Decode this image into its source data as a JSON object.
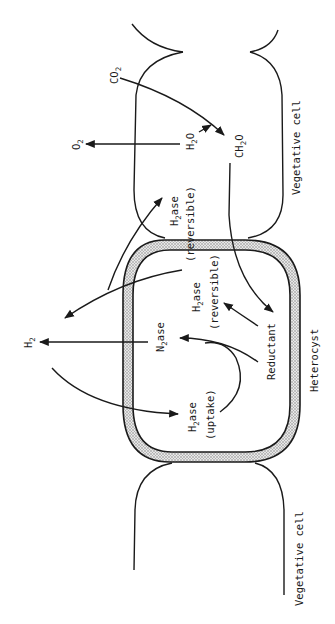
{
  "diagram": {
    "type": "hydrogen metabolism in heterocystous cyanobacteria",
    "orientation": "rotated 90 degrees counter-clockwise",
    "cells": {
      "vegetative_top": "Vegetative cell",
      "heterocyst": "Heterocyst",
      "vegetative_bottom": "Vegetative cell"
    },
    "labels": {
      "co2": {
        "main": "CO",
        "sub": "2"
      },
      "o2": {
        "main": "O",
        "sub": "2"
      },
      "h2o": {
        "main": "H",
        "sub": "2",
        "tail": "O"
      },
      "ch2o": {
        "main": "CH",
        "sub": "2",
        "tail": "O"
      },
      "h2": {
        "main": "H",
        "sub": "2"
      },
      "h2ase_reversible_veg": {
        "main": "H",
        "sub": "2",
        "tail": "ase",
        "note": "(reversible)"
      },
      "h2ase_reversible_het": {
        "main": "H",
        "sub": "2",
        "tail": "ase",
        "note": "(reversible)"
      },
      "n2ase": {
        "main": "N",
        "sub": "2",
        "tail": "ase"
      },
      "h2ase_uptake": {
        "main": "H",
        "sub": "2",
        "tail": "ase",
        "note": "(uptake)"
      },
      "reductant": "Reductant"
    },
    "edges": [
      {
        "from": "CO2",
        "to": "CH2O"
      },
      {
        "from": "H2O",
        "to": "CO2 -> CH2O pathway"
      },
      {
        "from": "H2O",
        "to": "O2"
      },
      {
        "from": "CH2O",
        "to": "Reductant"
      },
      {
        "from": "Reductant",
        "to": "H2ase (reversible, heterocyst)"
      },
      {
        "from": "Reductant",
        "to": "N2ase"
      },
      {
        "from": "N2ase",
        "to": "H2"
      },
      {
        "from": "H2ase (uptake)",
        "to": "N2ase"
      },
      {
        "from": "H2 (external)",
        "to": "H2ase (uptake)"
      },
      {
        "from": "H2ase (reversible, heterocyst)",
        "to": "H2 (external)"
      },
      {
        "from": "H2 (external)",
        "to": "H2ase (reversible, vegetative)"
      }
    ],
    "colors": {
      "ink": "#1a1a1a",
      "wall_fill": "#bdbdbd"
    }
  }
}
